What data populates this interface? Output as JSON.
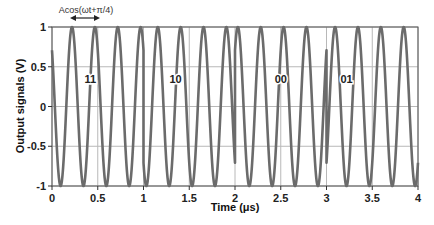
{
  "chart_data": {
    "type": "line",
    "title": "",
    "xlabel": "Time (μs)",
    "ylabel": "Output signals (V)",
    "xlim": [
      0,
      4
    ],
    "ylim": [
      -1,
      1
    ],
    "x_ticks": [
      "0",
      "0.5",
      "1",
      "1.5",
      "2",
      "2.5",
      "3",
      "3.5",
      "4"
    ],
    "y_ticks": [
      "1",
      "0.5",
      "0",
      "-0.5",
      "-1"
    ],
    "grid": true,
    "legend": null,
    "carrier_cycles_per_us": 4,
    "amplitude": 1,
    "symbol_duration_us": 1,
    "series": [
      {
        "name": "QPSK output signal",
        "color": "#6b6b6b",
        "segments": [
          {
            "symbol": "11",
            "t_start": 0,
            "t_end": 1,
            "phase": "π/4",
            "phase_rad": 0.7854
          },
          {
            "symbol": "10",
            "t_start": 1,
            "t_end": 2,
            "phase": "3π/4",
            "phase_rad": 2.3562
          },
          {
            "symbol": "00",
            "t_start": 2,
            "t_end": 3,
            "phase": "-π/4",
            "phase_rad": -0.7854
          },
          {
            "symbol": "01",
            "t_start": 3,
            "t_end": 4,
            "phase": "-3π/4",
            "phase_rad": -2.3562
          }
        ]
      }
    ],
    "annotations": [
      {
        "text": "Acos(ωt+π/4)",
        "x": 0.33,
        "y": 1.12,
        "arrow": "double-headed, one period (0.22 to 0.47 μs)"
      },
      {
        "text": "11",
        "x": 0.42,
        "y": 0.35
      },
      {
        "text": "10",
        "x": 1.35,
        "y": 0.35
      },
      {
        "text": "00",
        "x": 2.5,
        "y": 0.35
      },
      {
        "text": "01",
        "x": 3.22,
        "y": 0.35
      }
    ]
  }
}
